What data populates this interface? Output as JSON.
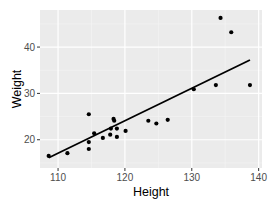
{
  "chart_data": {
    "type": "scatter",
    "title": "",
    "xlabel": "Height",
    "ylabel": "Weight",
    "xlim": [
      107.3,
      140.5
    ],
    "ylim": [
      13.9,
      48.0
    ],
    "x_ticks": [
      110,
      120,
      130,
      140
    ],
    "y_ticks": [
      20,
      30,
      40
    ],
    "grid": true,
    "legend": null,
    "series": [
      {
        "name": "points",
        "type": "scatter",
        "x": [
          108.6,
          111.4,
          114.6,
          115.4,
          114.6,
          114.6,
          116.7,
          117.8,
          118.3,
          118.4,
          117.9,
          118.8,
          118.8,
          120.1,
          123.5,
          124.7,
          126.4,
          130.3,
          133.6,
          134.3,
          135.9,
          138.7
        ],
        "y": [
          16.5,
          17.1,
          25.5,
          21.4,
          19.5,
          18.0,
          20.4,
          21.1,
          24.5,
          24.1,
          22.4,
          22.4,
          20.6,
          21.9,
          24.1,
          23.5,
          24.3,
          30.9,
          31.8,
          46.3,
          43.2,
          31.8
        ]
      },
      {
        "name": "linear fit",
        "type": "line",
        "x": [
          108.6,
          138.7
        ],
        "y": [
          16.1,
          37.2
        ]
      }
    ]
  },
  "labels": {
    "xlabel": "Height",
    "ylabel": "Weight",
    "x_ticks": [
      "110",
      "120",
      "130",
      "140"
    ],
    "y_ticks": [
      "20",
      "30",
      "40"
    ]
  },
  "colors": {
    "panel_bg": "#ebebeb",
    "grid_major": "#ffffff",
    "grid_minor": "#f5f5f5",
    "points": "#000000",
    "line": "#000000"
  }
}
